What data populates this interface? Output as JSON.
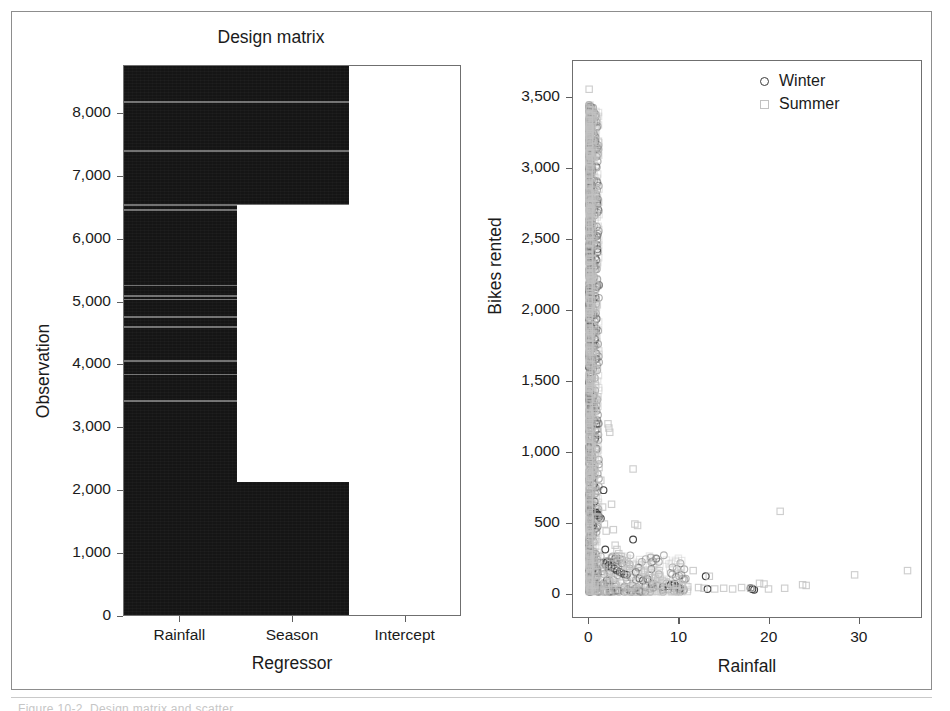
{
  "figure": {
    "caption_ghost": "Figure 10-2. Design matrix and scatter"
  },
  "panels": {
    "left": {
      "title": "Design matrix",
      "xlabel": "Regressor",
      "ylabel": "Observation",
      "xticklabels": [
        "Rainfall",
        "Season",
        "Intercept"
      ],
      "yticklabels": [
        "0",
        "1,000",
        "2,000",
        "3,000",
        "4,000",
        "5,000",
        "6,000",
        "7,000",
        "8,000"
      ]
    },
    "right": {
      "xlabel": "Rainfall",
      "ylabel": "Bikes rented",
      "xticklabels": [
        "0",
        "10",
        "20",
        "30"
      ],
      "yticklabels": [
        "0",
        "500",
        "1,000",
        "1,500",
        "2,000",
        "2,500",
        "3,000",
        "3,500"
      ],
      "legend": [
        {
          "label": "Winter",
          "marker": "circle",
          "color": "#3a3a3a"
        },
        {
          "label": "Summer",
          "marker": "square",
          "color": "#c2c2c2"
        }
      ]
    }
  },
  "chart_data": [
    {
      "type": "heatmap",
      "title": "Design matrix",
      "xlabel": "Regressor",
      "ylabel": "Observation",
      "categories": [
        "Rainfall",
        "Season",
        "Intercept"
      ],
      "ylim": [
        0,
        8760
      ],
      "yticks": [
        0,
        1000,
        2000,
        3000,
        4000,
        5000,
        6000,
        7000,
        8000
      ],
      "grid": false,
      "colormap": "binary (dark = nonzero, white = zero / not drawn)",
      "description": "Image of the design matrix columns. Rainfall column is dark for all observations. Season column is dark for observations 0-2150 and 6550-8760 and blank between. Intercept column is blank.",
      "columns": [
        {
          "name": "Rainfall",
          "dark_ranges": [
            [
              0,
              8760
            ]
          ]
        },
        {
          "name": "Season",
          "dark_ranges": [
            [
              0,
              2150
            ],
            [
              6550,
              8760
            ]
          ]
        },
        {
          "name": "Intercept",
          "dark_ranges": []
        }
      ],
      "light_stripes_observation": [
        3450,
        3870,
        4080,
        4620,
        4780,
        5060,
        5120,
        5280,
        6480,
        6560,
        7420,
        8200
      ]
    },
    {
      "type": "scatter",
      "title": "",
      "xlabel": "Rainfall",
      "ylabel": "Bikes rented",
      "xlim": [
        -1.8,
        37
      ],
      "ylim": [
        -170,
        3760
      ],
      "xticks": [
        0,
        10,
        20,
        30
      ],
      "yticks": [
        0,
        500,
        1000,
        1500,
        2000,
        2500,
        3000,
        3500
      ],
      "grid": false,
      "legend_position": "top-right",
      "series": [
        {
          "name": "Winter",
          "marker": "circle",
          "color": "#3a3a3a",
          "points": [
            [
              0.0,
              3320
            ],
            [
              0.0,
              3260
            ],
            [
              0.0,
              3210
            ],
            [
              0.0,
              3180
            ],
            [
              0.0,
              3150
            ],
            [
              0.0,
              3100
            ],
            [
              0.0,
              2990
            ],
            [
              0.0,
              2860
            ],
            [
              0.0,
              2740
            ],
            [
              0.0,
              2630
            ],
            [
              0.0,
              2510
            ],
            [
              0.0,
              2390
            ],
            [
              0.0,
              2280
            ],
            [
              0.0,
              2150
            ],
            [
              0.0,
              2040
            ],
            [
              0.0,
              1930
            ],
            [
              0.0,
              1820
            ],
            [
              0.0,
              1700
            ],
            [
              0.0,
              1590
            ],
            [
              0.0,
              1480
            ],
            [
              0.0,
              1360
            ],
            [
              0.0,
              1250
            ],
            [
              0.0,
              1140
            ],
            [
              0.0,
              1020
            ],
            [
              0.0,
              910
            ],
            [
              0.0,
              800
            ],
            [
              0.0,
              690
            ],
            [
              0.0,
              580
            ],
            [
              0.0,
              470
            ],
            [
              0.0,
              360
            ],
            [
              0.0,
              250
            ],
            [
              0.0,
              150
            ],
            [
              0.0,
              70
            ],
            [
              0.0,
              20
            ],
            [
              0.0,
              5
            ],
            [
              0.3,
              965
            ],
            [
              0.4,
              880
            ],
            [
              0.5,
              760
            ],
            [
              0.6,
              640
            ],
            [
              0.8,
              560
            ],
            [
              0.9,
              545
            ],
            [
              1.0,
              540
            ],
            [
              1.1,
              530
            ],
            [
              1.3,
              520
            ],
            [
              1.6,
              720
            ],
            [
              1.8,
              300
            ],
            [
              2.0,
              210
            ],
            [
              2.2,
              190
            ],
            [
              2.5,
              175
            ],
            [
              2.8,
              165
            ],
            [
              3.1,
              150
            ],
            [
              3.4,
              140
            ],
            [
              3.6,
              135
            ],
            [
              3.9,
              125
            ],
            [
              4.2,
              120
            ],
            [
              4.9,
              370
            ],
            [
              5.2,
              140
            ],
            [
              5.6,
              95
            ],
            [
              6.0,
              80
            ],
            [
              6.5,
              90
            ],
            [
              7.0,
              55
            ],
            [
              7.6,
              45
            ],
            [
              8.2,
              35
            ],
            [
              8.8,
              40
            ],
            [
              9.1,
              50
            ],
            [
              9.3,
              45
            ],
            [
              9.5,
              55
            ],
            [
              9.7,
              40
            ],
            [
              9.9,
              30
            ],
            [
              10.1,
              20
            ],
            [
              13.0,
              110
            ],
            [
              13.2,
              20
            ],
            [
              18.0,
              25
            ],
            [
              18.2,
              20
            ],
            [
              18.4,
              15
            ]
          ]
        },
        {
          "name": "Summer",
          "marker": "square",
          "color": "#c2c2c2",
          "points": [
            [
              0.0,
              3560
            ],
            [
              0.0,
              3430
            ],
            [
              0.0,
              3380
            ],
            [
              0.0,
              3340
            ],
            [
              0.0,
              3290
            ],
            [
              0.0,
              3230
            ],
            [
              0.0,
              3170
            ],
            [
              0.0,
              3110
            ],
            [
              0.0,
              3050
            ],
            [
              0.0,
              2960
            ],
            [
              0.0,
              2880
            ],
            [
              0.0,
              2790
            ],
            [
              0.0,
              2700
            ],
            [
              0.0,
              2610
            ],
            [
              0.0,
              2520
            ],
            [
              0.0,
              2430
            ],
            [
              0.0,
              2340
            ],
            [
              0.0,
              2250
            ],
            [
              0.0,
              2160
            ],
            [
              0.0,
              2070
            ],
            [
              0.0,
              1980
            ],
            [
              0.0,
              1890
            ],
            [
              0.0,
              1800
            ],
            [
              0.0,
              1710
            ],
            [
              0.0,
              1620
            ],
            [
              0.0,
              1530
            ],
            [
              0.0,
              1440
            ],
            [
              0.0,
              1350
            ],
            [
              0.0,
              1260
            ],
            [
              0.0,
              1170
            ],
            [
              0.0,
              1080
            ],
            [
              0.0,
              990
            ],
            [
              0.0,
              900
            ],
            [
              0.0,
              810
            ],
            [
              0.0,
              720
            ],
            [
              0.0,
              630
            ],
            [
              0.0,
              540
            ],
            [
              0.0,
              450
            ],
            [
              0.0,
              360
            ],
            [
              0.0,
              270
            ],
            [
              0.0,
              180
            ],
            [
              0.0,
              90
            ],
            [
              0.0,
              30
            ],
            [
              0.6,
              1290
            ],
            [
              1.0,
              1130
            ],
            [
              1.1,
              880
            ],
            [
              1.3,
              790
            ],
            [
              1.5,
              600
            ],
            [
              1.7,
              480
            ],
            [
              1.9,
              430
            ],
            [
              2.1,
              1190
            ],
            [
              2.2,
              1160
            ],
            [
              2.3,
              1130
            ],
            [
              2.5,
              620
            ],
            [
              2.7,
              440
            ],
            [
              2.9,
              330
            ],
            [
              3.1,
              300
            ],
            [
              3.3,
              270
            ],
            [
              3.6,
              250
            ],
            [
              3.9,
              220
            ],
            [
              4.2,
              200
            ],
            [
              4.5,
              180
            ],
            [
              4.9,
              870
            ],
            [
              5.1,
              480
            ],
            [
              5.4,
              470
            ],
            [
              5.8,
              150
            ],
            [
              6.2,
              140
            ],
            [
              6.6,
              120
            ],
            [
              7.0,
              100
            ],
            [
              7.4,
              95
            ],
            [
              7.8,
              150
            ],
            [
              8.2,
              80
            ],
            [
              8.6,
              70
            ],
            [
              9.0,
              60
            ],
            [
              9.4,
              55
            ],
            [
              9.8,
              50
            ],
            [
              10.4,
              40
            ],
            [
              11.0,
              35
            ],
            [
              11.6,
              150
            ],
            [
              12.2,
              30
            ],
            [
              12.8,
              25
            ],
            [
              13.4,
              110
            ],
            [
              14.0,
              20
            ],
            [
              15.0,
              25
            ],
            [
              16.0,
              20
            ],
            [
              17.0,
              30
            ],
            [
              18.0,
              25
            ],
            [
              19.0,
              60
            ],
            [
              19.5,
              55
            ],
            [
              20.0,
              20
            ],
            [
              21.3,
              570
            ],
            [
              21.8,
              25
            ],
            [
              23.8,
              50
            ],
            [
              24.2,
              45
            ],
            [
              29.6,
              120
            ],
            [
              35.5,
              150
            ]
          ]
        }
      ]
    }
  ]
}
